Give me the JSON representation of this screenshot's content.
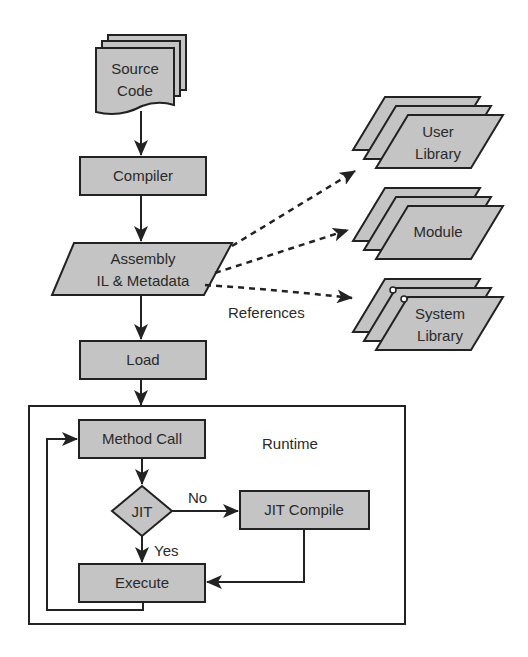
{
  "diagram": {
    "type": "flowchart",
    "nodes": {
      "source_code": {
        "line1": "Source",
        "line2": "Code",
        "shape": "multi-document"
      },
      "compiler": {
        "label": "Compiler",
        "shape": "process"
      },
      "assembly": {
        "line1": "Assembly",
        "line2": "IL & Metadata",
        "shape": "data"
      },
      "load": {
        "label": "Load",
        "shape": "process"
      },
      "user_library": {
        "line1": "User",
        "line2": "Library",
        "shape": "stacked-data"
      },
      "module": {
        "label": "Module",
        "shape": "stacked-data"
      },
      "system_library": {
        "line1": "System",
        "line2": "Library",
        "shape": "stacked-data"
      },
      "method_call": {
        "label": "Method Call",
        "shape": "process"
      },
      "jit": {
        "label": "JIT",
        "shape": "decision"
      },
      "jit_compile": {
        "label": "JIT Compile",
        "shape": "process"
      },
      "execute": {
        "label": "Execute",
        "shape": "process"
      }
    },
    "labels": {
      "references": "References",
      "runtime": "Runtime",
      "no": "No",
      "yes": "Yes"
    },
    "colors": {
      "fill": "#c4c4c4",
      "stroke": "#222222",
      "text": "#2a2a2a",
      "background": "#ffffff"
    }
  }
}
